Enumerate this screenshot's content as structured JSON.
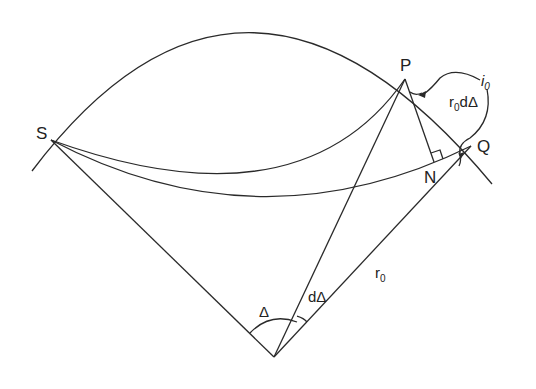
{
  "figure": {
    "type": "ray-path geometry (epicentral distance)",
    "points": {
      "S": "S",
      "P": "P",
      "Q": "Q",
      "N": "N"
    },
    "labels": {
      "delta": "Δ",
      "d_delta": "dΔ",
      "r0_main": "r",
      "r0_sub": "0",
      "i0_main": "i",
      "i0_sub": "0",
      "r0d_main": "r",
      "r0d_sub": "0",
      "r0d_tail": "dΔ"
    },
    "stroke_color": "#2a2a2a",
    "background": "#ffffff"
  }
}
